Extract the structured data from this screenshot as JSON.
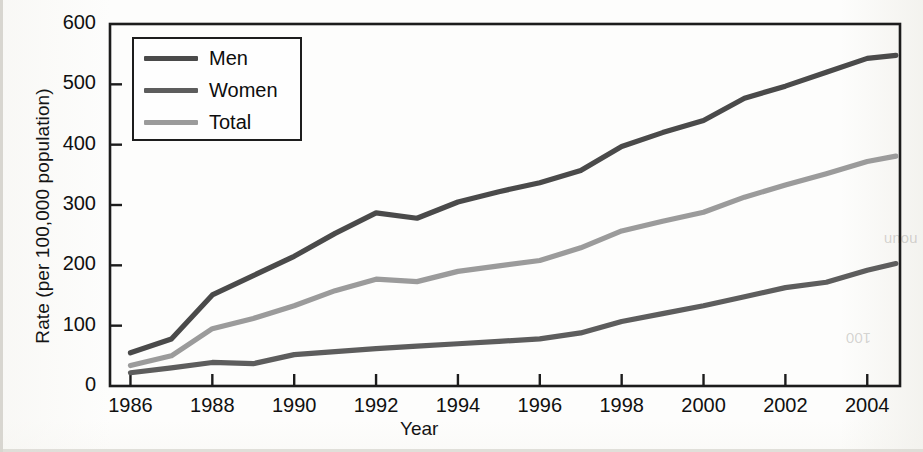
{
  "chart_data": {
    "type": "line",
    "title": "",
    "xlabel": "Year",
    "ylabel": "Rate (per 100,000 population)",
    "xlim": [
      1985.5,
      2004.8
    ],
    "ylim": [
      0,
      600
    ],
    "grid": false,
    "legend_position": "top-left",
    "ytick_labels": [
      "600",
      "500",
      "400",
      "300",
      "200",
      "100",
      "0"
    ],
    "ytick_values": [
      600,
      500,
      400,
      300,
      200,
      100,
      0
    ],
    "xtick_labels": [
      "1986",
      "1988",
      "1990",
      "1992",
      "1994",
      "1996",
      "1998",
      "2000",
      "2002",
      "2004"
    ],
    "xtick_values": [
      1986,
      1988,
      1990,
      1992,
      1994,
      1996,
      1998,
      2000,
      2002,
      2004
    ],
    "x": [
      1986,
      1987,
      1988,
      1989,
      1990,
      1991,
      1992,
      1993,
      1994,
      1995,
      1996,
      1997,
      1998,
      1999,
      2000,
      2001,
      2002,
      2003,
      2004,
      2004.7
    ],
    "series": [
      {
        "name": "Men",
        "color": "#4a4a4a",
        "values": [
          55,
          78,
          151,
          183,
          215,
          253,
          287,
          278,
          305,
          322,
          337,
          357,
          397,
          420,
          440,
          477,
          497,
          520,
          543,
          548
        ]
      },
      {
        "name": "Women",
        "color": "#5d5d5d",
        "values": [
          22,
          30,
          39,
          37,
          52,
          57,
          62,
          66,
          70,
          74,
          78,
          88,
          107,
          120,
          133,
          148,
          163,
          172,
          192,
          203
        ]
      },
      {
        "name": "Total",
        "color": "#9b9b9b",
        "values": [
          34,
          50,
          95,
          112,
          133,
          158,
          177,
          173,
          190,
          199,
          208,
          229,
          257,
          273,
          288,
          313,
          333,
          352,
          372,
          381
        ]
      }
    ]
  },
  "legend": {
    "items": [
      {
        "label": "Men"
      },
      {
        "label": "Women"
      },
      {
        "label": "Total"
      }
    ]
  },
  "axes": {
    "border_color": "#1c1c1c",
    "tick_color": "#1c1c1c"
  },
  "ghost_marginalia": [
    {
      "text": "100",
      "x": 846,
      "y": 330
    },
    {
      "text": "noun",
      "x": 884,
      "y": 232
    }
  ]
}
